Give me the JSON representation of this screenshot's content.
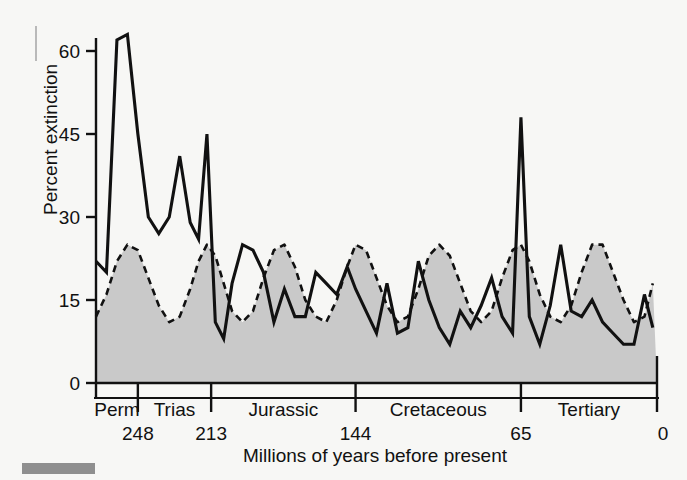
{
  "figure": {
    "name": "mass-extinction-periodicity-chart",
    "background_color": "#f7f7f5",
    "ink_color": "#111111",
    "fill_color": "#c9c9c9"
  },
  "axes": {
    "y_title": "Percent extinction",
    "x_title": "Millions of years before present",
    "y_ticks": [
      "0",
      "15",
      "30",
      "45",
      "60"
    ],
    "x_boundary_ages": [
      "248",
      "213",
      "144",
      "65",
      "0"
    ]
  },
  "periods": [
    {
      "label": "Perm"
    },
    {
      "label": "Trias"
    },
    {
      "label": "Jurassic"
    },
    {
      "label": "Cretaceous"
    },
    {
      "label": "Tertiary"
    }
  ],
  "chart_data": {
    "type": "line",
    "title": "",
    "subtitle": "",
    "xlabel": "Millions of years before present",
    "ylabel": "Percent extinction",
    "xlim": [
      268,
      0
    ],
    "ylim": [
      0,
      66
    ],
    "x_reversed": true,
    "grid": false,
    "legend": "none",
    "y_ticks": [
      0,
      15,
      30,
      45,
      60
    ],
    "x_boundary_ages": [
      248,
      213,
      144,
      65,
      0
    ],
    "period_spans": [
      {
        "name": "Perm",
        "from": 268,
        "to": 248
      },
      {
        "name": "Trias",
        "from": 248,
        "to": 213
      },
      {
        "name": "Jurassic",
        "from": 213,
        "to": 144
      },
      {
        "name": "Cretaceous",
        "from": 144,
        "to": 65
      },
      {
        "name": "Tertiary",
        "from": 65,
        "to": 0
      }
    ],
    "series": [
      {
        "name": "Percent extinction (observed)",
        "style": "solid",
        "color": "#111111",
        "x": [
          268,
          263,
          258,
          253,
          248,
          243,
          238,
          233,
          228,
          223,
          219,
          215,
          211,
          207,
          203,
          198,
          193,
          188,
          183,
          178,
          173,
          168,
          163,
          158,
          153,
          148,
          144,
          139,
          134,
          129,
          124,
          119,
          114,
          109,
          104,
          99,
          94,
          89,
          84,
          79,
          74,
          69,
          65,
          61,
          56,
          51,
          46,
          41,
          36,
          31,
          26,
          21,
          16,
          11,
          6,
          2
        ],
        "values": [
          22,
          20,
          62,
          63,
          45,
          30,
          27,
          30,
          41,
          29,
          26,
          45,
          11,
          8,
          18,
          25,
          24,
          20,
          11,
          17,
          12,
          12,
          20,
          18,
          16,
          21,
          17,
          13,
          9,
          18,
          9,
          10,
          22,
          15,
          10,
          7,
          13,
          10,
          14,
          19,
          12,
          9,
          48,
          12,
          7,
          14,
          25,
          13,
          12,
          15,
          11,
          9,
          7,
          7,
          16,
          10
        ]
      },
      {
        "name": "Fitted 26-Myr periodic signal",
        "style": "dashed",
        "color": "#111111",
        "fill": "#c9c9c9",
        "x": [
          268,
          263,
          258,
          253,
          248,
          243,
          238,
          233,
          228,
          223,
          219,
          215,
          211,
          207,
          203,
          198,
          193,
          188,
          183,
          178,
          173,
          168,
          163,
          158,
          153,
          148,
          144,
          139,
          134,
          129,
          124,
          119,
          114,
          109,
          104,
          99,
          94,
          89,
          84,
          79,
          74,
          69,
          65,
          61,
          56,
          51,
          46,
          41,
          36,
          31,
          26,
          21,
          16,
          11,
          6,
          2
        ],
        "values": [
          12,
          16,
          22,
          25,
          24,
          19,
          14,
          11,
          12,
          17,
          22,
          25,
          23,
          18,
          13,
          11,
          13,
          19,
          24,
          25,
          21,
          15,
          12,
          11,
          15,
          21,
          25,
          24,
          19,
          14,
          11,
          12,
          17,
          23,
          25,
          23,
          18,
          13,
          11,
          13,
          19,
          24,
          25,
          22,
          16,
          12,
          11,
          14,
          20,
          25,
          25,
          20,
          15,
          11,
          12,
          18
        ]
      }
    ]
  }
}
